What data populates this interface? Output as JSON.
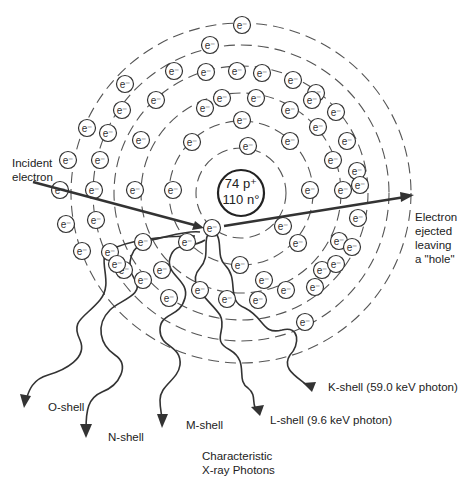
{
  "diagram": {
    "nucleus": {
      "line1": "74 p⁺",
      "line2": "110 n°",
      "cx": 241,
      "cy": 193,
      "r": 23
    },
    "shells": [
      {
        "name": "K",
        "r": 45
      },
      {
        "name": "L",
        "r": 72
      },
      {
        "name": "M",
        "r": 100
      },
      {
        "name": "N",
        "r": 127
      },
      {
        "name": "O",
        "r": 148
      },
      {
        "name": "P",
        "r": 170
      }
    ],
    "electron_symbol": "e⁻",
    "labels": {
      "incident": "Incident\nelectron",
      "ejected": "Electron\nejected\nleaving\na \"hole\"",
      "k_shell": "K-shell (59.0 keV photon)",
      "l_shell": "L-shell (9.6 keV photon)",
      "m_shell": "M-shell",
      "n_shell": "N-shell",
      "o_shell": "O-shell",
      "caption": "Characteristic\nX-ray Photons"
    },
    "electrons": [
      [
        212,
        228
      ],
      [
        248,
        146
      ],
      [
        283,
        226
      ],
      [
        192,
        142
      ],
      [
        242,
        120
      ],
      [
        290,
        141
      ],
      [
        173,
        190
      ],
      [
        310,
        190
      ],
      [
        187,
        242
      ],
      [
        298,
        243
      ],
      [
        240,
        265
      ],
      [
        156,
        100
      ],
      [
        222,
        98
      ],
      [
        256,
        98
      ],
      [
        290,
        110
      ],
      [
        205,
        108
      ],
      [
        318,
        127
      ],
      [
        141,
        140
      ],
      [
        333,
        160
      ],
      [
        135,
        190
      ],
      [
        343,
        190
      ],
      [
        143,
        242
      ],
      [
        339,
        241
      ],
      [
        162,
        270
      ],
      [
        322,
        270
      ],
      [
        200,
        290
      ],
      [
        286,
        290
      ],
      [
        227,
        299
      ],
      [
        258,
        300
      ],
      [
        174,
        71
      ],
      [
        206,
        72
      ],
      [
        237,
        71
      ],
      [
        262,
        73
      ],
      [
        293,
        80
      ],
      [
        122,
        110
      ],
      [
        316,
        93
      ],
      [
        108,
        133
      ],
      [
        336,
        112
      ],
      [
        100,
        160
      ],
      [
        347,
        141
      ],
      [
        94,
        190
      ],
      [
        357,
        171
      ],
      [
        96,
        220
      ],
      [
        358,
        218
      ],
      [
        110,
        252
      ],
      [
        352,
        247
      ],
      [
        124,
        270
      ],
      [
        336,
        264
      ],
      [
        143,
        280
      ],
      [
        315,
        287
      ],
      [
        169,
        298
      ],
      [
        264,
        280
      ],
      [
        210,
        45
      ],
      [
        125,
        84
      ],
      [
        87,
        128
      ],
      [
        68,
        160
      ],
      [
        60,
        190
      ],
      [
        66,
        224
      ],
      [
        82,
        251
      ],
      [
        117,
        264
      ],
      [
        312,
        100
      ],
      [
        360,
        185
      ],
      [
        305,
        322
      ],
      [
        242,
        25
      ]
    ],
    "photons": [
      "K-shell",
      "L-shell",
      "M-shell",
      "N-shell",
      "O-shell"
    ]
  }
}
